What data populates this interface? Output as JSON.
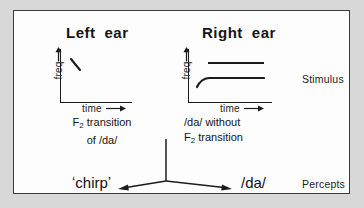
{
  "figure": {
    "background_color": "#d8d8d8",
    "panel_color": "#fdfdfd",
    "border_color": "#3a3a3a",
    "ink_color": "#161616"
  },
  "panels": {
    "left": {
      "title_word1": "Left",
      "title_word2": "ear",
      "axis": {
        "y_label": "freq",
        "y_arrow_icon": "up-arrow-icon",
        "x_label": "time",
        "x_arrow_icon": "right-arrow-icon"
      },
      "trace_description": "short downward-sloping F2 transition stroke",
      "caption_line1": "F",
      "caption_sub1": "2",
      "caption_line1_rest": " transition",
      "caption_line2": "of /da/"
    },
    "right": {
      "title_word1": "Right",
      "title_word2": "ear",
      "axis": {
        "y_label": "freq",
        "y_arrow_icon": "up-arrow-icon",
        "x_label": "time",
        "x_arrow_icon": "right-arrow-icon"
      },
      "trace_description": "upper steady formant line plus lower rising-then-steady formant",
      "caption_line1": "/da/ without",
      "caption_line2_pre": "F",
      "caption_sub2": "2",
      "caption_line2_rest": " transition"
    }
  },
  "side_labels": {
    "stimulus": "Stimulus",
    "percepts": "Percepts"
  },
  "percepts": {
    "left_open_quote": "ʻ",
    "left_word": "chirp",
    "left_close_quote": "ʼ",
    "right_word": "/da/",
    "arrow_left_icon": "arrow-left-icon",
    "arrow_right_icon": "arrow-right-icon",
    "fork_icon": "fork-junction-icon"
  }
}
